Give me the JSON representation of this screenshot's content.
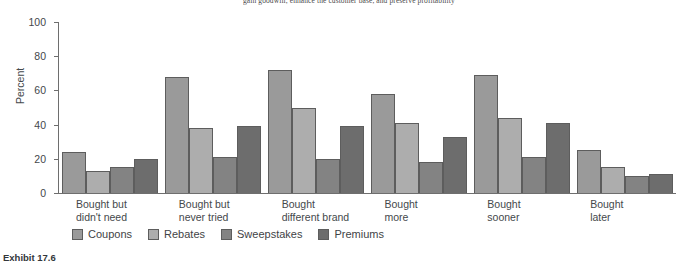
{
  "top_text": "gain goodwill, enhance the customer base, and preserve profitability",
  "exhibit_caption": "Exhibit 17.6",
  "chart_data": {
    "type": "bar",
    "title": "",
    "xlabel": "",
    "ylabel": "Percent",
    "ylim": [
      0,
      100
    ],
    "yticks": [
      0,
      20,
      40,
      60,
      80,
      100
    ],
    "ytick_labels": [
      "0",
      "20",
      "40",
      "60",
      "80",
      "100"
    ],
    "grid": false,
    "legend_position": "bottom-left",
    "categories": [
      "Bought but didn't need",
      "Bought but never tried",
      "Bought different brand",
      "Bought more",
      "Bought sooner",
      "Bought later"
    ],
    "category_lines": [
      [
        "Bought but",
        "didn't need"
      ],
      [
        "Bought but",
        "never tried"
      ],
      [
        "Bought",
        "different brand"
      ],
      [
        "Bought",
        "more"
      ],
      [
        "Bought",
        "sooner"
      ],
      [
        "Bought",
        "later"
      ]
    ],
    "series": [
      {
        "name": "Coupons",
        "color": "#9a9a9a",
        "values": [
          24,
          68,
          72,
          58,
          69,
          25
        ]
      },
      {
        "name": "Rebates",
        "color": "#adadad",
        "values": [
          13,
          38,
          50,
          41,
          44,
          15
        ]
      },
      {
        "name": "Sweepstakes",
        "color": "#838383",
        "values": [
          15,
          21,
          20,
          18,
          21,
          10
        ]
      },
      {
        "name": "Premiums",
        "color": "#6d6d6d",
        "values": [
          20,
          39,
          39,
          33,
          41,
          11
        ]
      }
    ]
  }
}
